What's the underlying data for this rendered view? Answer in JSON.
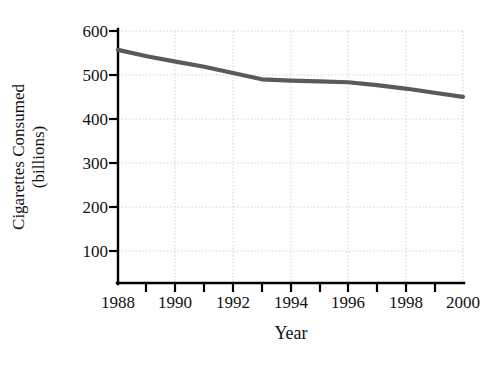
{
  "figure": {
    "clipped_title_fragment": "........",
    "background_color": "#ffffff"
  },
  "axes": {
    "x_title": "Year",
    "y_title_line1": "Cigarettes Consumed",
    "y_title_line2": "(billions)",
    "y_ticks": [
      "100",
      "200",
      "300",
      "400",
      "500",
      "600"
    ],
    "x_ticks": [
      "1988",
      "1990",
      "1992",
      "1994",
      "1996",
      "1998",
      "2000"
    ],
    "axis_color": "#000000",
    "grid_color": "#cccccc",
    "line_color": "#5a5a5a"
  },
  "chart_data": {
    "type": "line",
    "title": "",
    "xlabel": "Year",
    "ylabel": "Cigarettes Consumed (billions)",
    "xlim": [
      1988,
      2000
    ],
    "ylim": [
      0,
      600
    ],
    "xticks": [
      1988,
      1990,
      1992,
      1994,
      1996,
      1998,
      2000
    ],
    "xticks_minor": [
      1989,
      1991,
      1993,
      1995,
      1997,
      1999
    ],
    "yticks": [
      100,
      200,
      300,
      400,
      500,
      600
    ],
    "grid": "dotted, both axes",
    "legend": "none",
    "series": [
      {
        "name": "Cigarettes Consumed (billions)",
        "color": "#5a5a5a",
        "x": [
          1988,
          1989,
          1990,
          1991,
          1992,
          1993,
          1994,
          1995,
          1996,
          1997,
          1998,
          1999,
          2000
        ],
        "values": [
          555,
          540,
          527,
          515,
          500,
          485,
          482,
          480,
          478,
          471,
          463,
          453,
          443
        ]
      }
    ]
  }
}
